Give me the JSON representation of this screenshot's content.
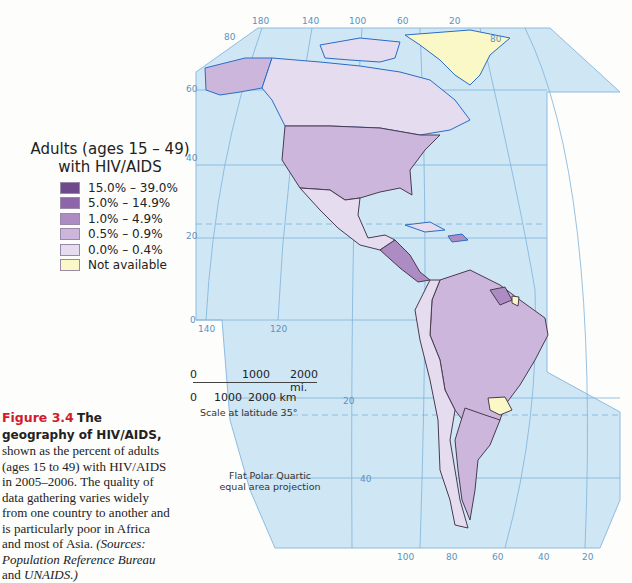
{
  "legend": {
    "title_line1": "Adults (ages 15 – 49)",
    "title_line2": "with HIV/AIDS",
    "items": [
      {
        "label": "15.0% – 39.0%",
        "color": "#6e4a8c"
      },
      {
        "label": "5.0% – 14.9%",
        "color": "#8d66aa"
      },
      {
        "label": "1.0% – 4.9%",
        "color": "#ad8cc4"
      },
      {
        "label": "0.5% – 0.9%",
        "color": "#cdb6dc"
      },
      {
        "label": "0.0% – 0.4%",
        "color": "#e6dcef"
      },
      {
        "label": "Not available",
        "color": "#fbf8c8"
      }
    ]
  },
  "caption": {
    "figure_number": "Figure 3.4",
    "lead": "The geography of HIV/AIDS,",
    "body": " shown as the percent of adults (ages 15 to 49) with HIV/AIDS in 2005–2006. The quality of data gathering varies widely from one country to another and is particularly poor in Africa and most of Asia. ",
    "source_open": "(Sources: ",
    "source_1": "Population Reference Bureau",
    "source_and": " and ",
    "source_2": "UNAIDS.)"
  },
  "scale": {
    "mi_labels": [
      "0",
      "1000",
      "2000 mi."
    ],
    "km_labels": [
      "0",
      "1000",
      "2000 km"
    ],
    "note": "Scale at latitude 35°"
  },
  "projection": {
    "line1": "Flat Polar Quartic",
    "line2": "equal area projection"
  },
  "grid_labels": {
    "top_longitudes": [
      "180",
      "140",
      "100",
      "60",
      "20"
    ],
    "lat_80_left": "80",
    "lat_80_right": "80",
    "lat_60": "60",
    "lat_40": "40",
    "lat_20": "20",
    "lat_0": "0",
    "mid_longitudes": [
      "140",
      "120"
    ],
    "south_lat_20": "20",
    "south_lat_40": "40",
    "bottom_longitudes": [
      "100",
      "80",
      "60",
      "40",
      "20"
    ]
  },
  "colors": {
    "ocean": "#cfe6f5",
    "grid": "#7eb2da",
    "coast": "#2a6cc4",
    "border": "#4a3a50"
  },
  "regions": [
    {
      "name": "Greenland",
      "class": "Not available"
    },
    {
      "name": "Alaska/United States",
      "class": "0.5% – 0.9%"
    },
    {
      "name": "Canada",
      "class": "0.0% – 0.4%"
    },
    {
      "name": "Mexico",
      "class": "0.0% – 0.4%"
    },
    {
      "name": "Guatemala/Honduras",
      "class": "0.5% – 0.9% / 1.0% – 4.9%"
    },
    {
      "name": "Haiti",
      "class": "1.0% – 4.9%"
    },
    {
      "name": "Guyana/Suriname",
      "class": "1.0% – 4.9%"
    },
    {
      "name": "French Guiana",
      "class": "Not available"
    },
    {
      "name": "Brazil/Venezuela/Argentina",
      "class": "0.5% – 0.9%"
    },
    {
      "name": "Paraguay",
      "class": "Not available"
    },
    {
      "name": "Colombia/Peru/Bolivia/Chile/Uruguay",
      "class": "0.0% – 0.4%"
    }
  ]
}
